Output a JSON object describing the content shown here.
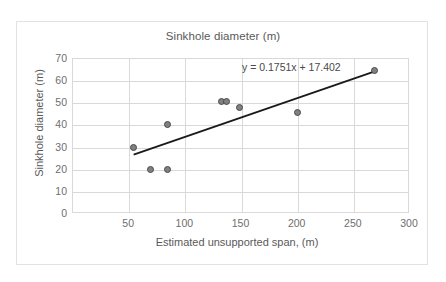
{
  "chart_data": {
    "type": "scatter",
    "title": "Sinkhole diameter (m)",
    "xlabel": "Estimated unsupported span, (m)",
    "ylabel": "Sinkhole diameter (m)",
    "xlim": [
      0,
      300
    ],
    "ylim": [
      0,
      70
    ],
    "xticks": [
      50,
      100,
      150,
      200,
      250,
      300
    ],
    "yticks": [
      0,
      10,
      20,
      30,
      40,
      50,
      60,
      70
    ],
    "grid": true,
    "legend": "none",
    "series": [
      {
        "name": "Sinkhole observations",
        "marker": "circle",
        "color": "#808080",
        "points": [
          {
            "x": 54,
            "y": 30
          },
          {
            "x": 69,
            "y": 20
          },
          {
            "x": 84,
            "y": 20
          },
          {
            "x": 84,
            "y": 40.5
          },
          {
            "x": 132,
            "y": 51
          },
          {
            "x": 137,
            "y": 51
          },
          {
            "x": 148,
            "y": 48
          },
          {
            "x": 200,
            "y": 46
          },
          {
            "x": 268,
            "y": 65
          }
        ]
      }
    ],
    "trendline": {
      "type": "linear",
      "slope": 0.1751,
      "intercept": 17.402,
      "equation": "y = 0.1751x + 17.402",
      "x_start": 54,
      "x_end": 268,
      "color": "#1a1a1a"
    }
  },
  "axis": {
    "y_tick_labels": [
      "70",
      "60",
      "50",
      "40",
      "30",
      "20",
      "10",
      "0"
    ],
    "x_tick_labels": [
      "50",
      "100",
      "150",
      "200",
      "250",
      "300"
    ]
  }
}
